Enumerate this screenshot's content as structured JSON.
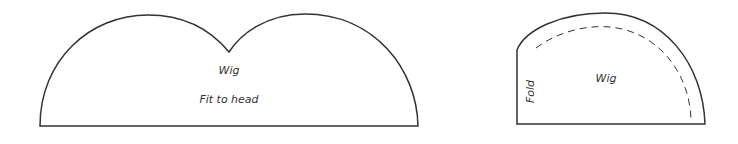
{
  "pieces": [
    {
      "name": "wig-front",
      "label": "Wig",
      "note": "Fit to head"
    },
    {
      "name": "wig-back",
      "label": "Wig",
      "fold_label": "Fold"
    }
  ],
  "colors": {
    "stroke": "#333333",
    "background": "#ffffff"
  }
}
